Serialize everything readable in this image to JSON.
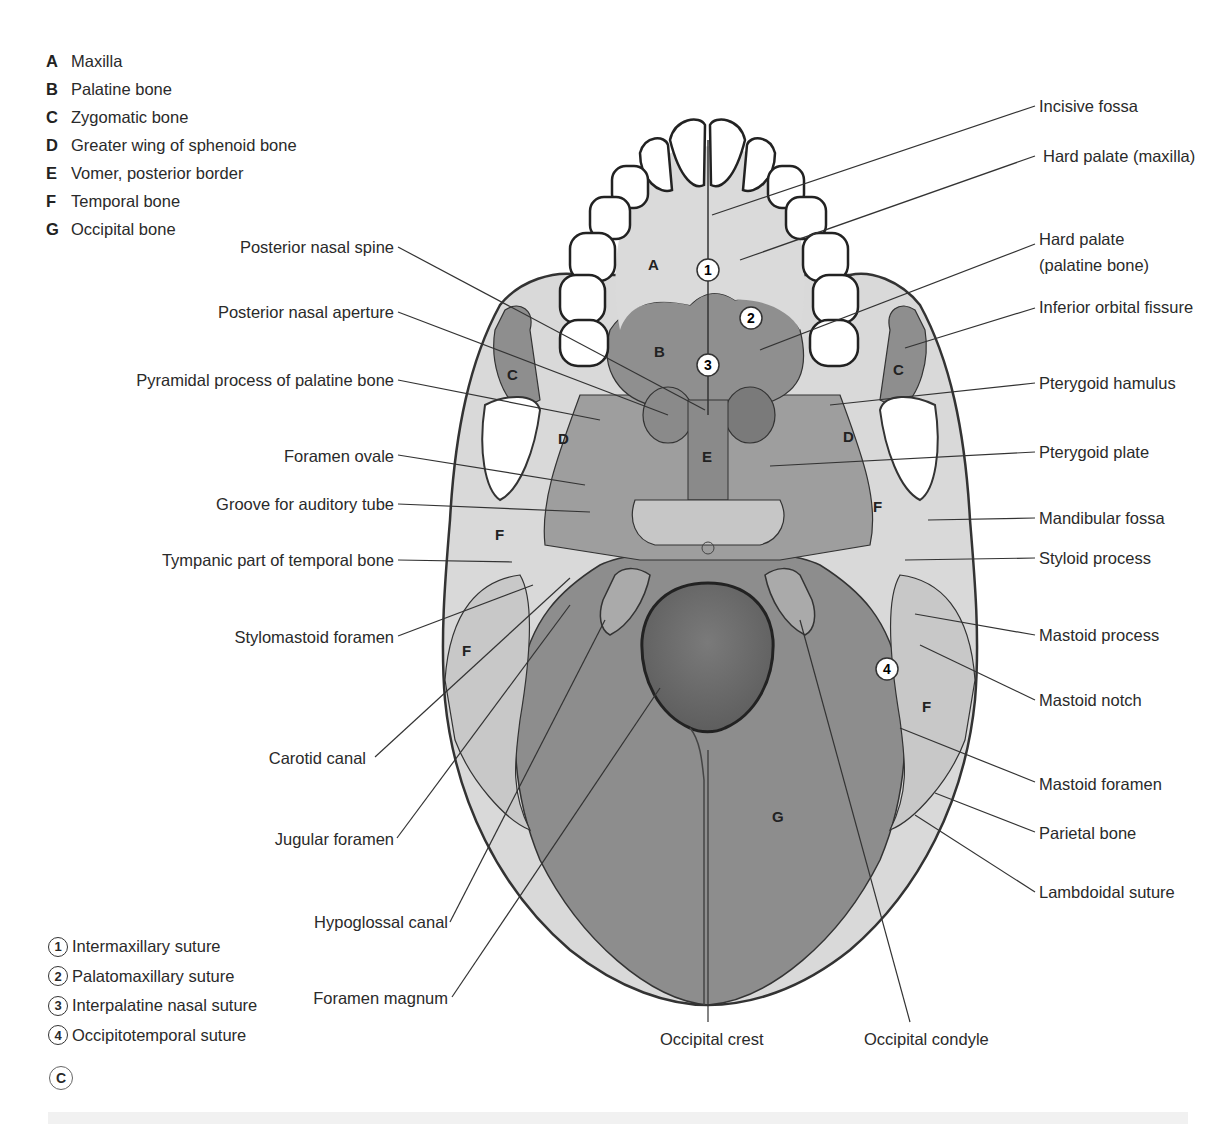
{
  "bone_legend": [
    {
      "key": "A",
      "label": "Maxilla"
    },
    {
      "key": "B",
      "label": "Palatine bone"
    },
    {
      "key": "C",
      "label": "Zygomatic bone"
    },
    {
      "key": "D",
      "label": "Greater wing of sphenoid bone"
    },
    {
      "key": "E",
      "label": "Vomer, posterior border"
    },
    {
      "key": "F",
      "label": "Temporal bone"
    },
    {
      "key": "G",
      "label": "Occipital bone"
    }
  ],
  "suture_legend": [
    {
      "num": "1",
      "label": "Intermaxillary suture"
    },
    {
      "num": "2",
      "label": "Palatomaxillary suture"
    },
    {
      "num": "3",
      "label": "Interpalatine nasal suture"
    },
    {
      "num": "4",
      "label": "Occipitotemporal suture"
    }
  ],
  "copyright_symbol": "C",
  "left_labels": [
    "Posterior nasal spine",
    "Posterior nasal aperture",
    "Pyramidal process of palatine bone",
    "Foramen ovale",
    "Groove for auditory tube",
    "Tympanic part of temporal bone",
    "Stylomastoid foramen",
    "Carotid canal",
    "Jugular foramen",
    "Hypoglossal canal",
    "Foramen magnum"
  ],
  "right_labels": [
    "Incisive fossa",
    "Hard palate (maxilla)",
    "Hard palate",
    "(palatine bone)",
    "Inferior orbital fissure",
    "Pterygoid hamulus",
    "Pterygoid plate",
    "Mandibular fossa",
    "Styloid process",
    "Mastoid process",
    "Mastoid notch",
    "Mastoid foramen",
    "Parietal bone",
    "Lambdoidal suture"
  ],
  "bottom_labels": [
    "Occipital crest",
    "Occipital condyle"
  ],
  "region_letters": {
    "A": "A",
    "B": "B",
    "C": "C",
    "D": "D",
    "E": "E",
    "F": "F",
    "G": "G"
  },
  "suture_markers": {
    "1": "1",
    "2": "2",
    "3": "3",
    "4": "4"
  },
  "colors": {
    "light_bone": "#d9d9d9",
    "mid_bone": "#9c9c9c",
    "dark_bone": "#8a8a8a",
    "teeth": "#ffffff",
    "outline": "#333333"
  }
}
